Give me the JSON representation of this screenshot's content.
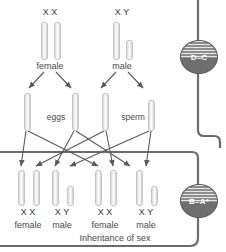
{
  "diagram": {
    "caption": "Inheritance of sex",
    "parents": [
      {
        "id": "mother",
        "alleles": "X X",
        "label": "female",
        "chromosomes": [
          "X",
          "X"
        ]
      },
      {
        "id": "father",
        "alleles": "X Y",
        "label": "male",
        "chromosomes": [
          "X",
          "Y"
        ]
      }
    ],
    "gametes": [
      {
        "id": "eggs",
        "label": "eggs",
        "chromosomes": [
          "X",
          "X"
        ]
      },
      {
        "id": "sperm",
        "label": "sperm",
        "chromosomes": [
          "X",
          "Y"
        ]
      }
    ],
    "offspring": [
      {
        "alleles": "X X",
        "label": "female",
        "chromosomes": [
          "X",
          "X"
        ]
      },
      {
        "alleles": "X Y",
        "label": "male",
        "chromosomes": [
          "X",
          "Y"
        ]
      },
      {
        "alleles": "X X",
        "label": "female",
        "chromosomes": [
          "X",
          "X"
        ]
      },
      {
        "alleles": "X Y",
        "label": "male",
        "chromosomes": [
          "X",
          "Y"
        ]
      }
    ]
  },
  "grade_badges": [
    {
      "id": "badge-d-c",
      "text": "D–C"
    },
    {
      "id": "badge-b-a-star",
      "text": "B–A*"
    }
  ],
  "colors": {
    "badge_fill": "#6f6f6f",
    "badge_text": "#ffffff",
    "frame_line": "#6b6b6b",
    "arrow": "#5a5a5a",
    "text": "#4a4a4a",
    "chromosome": "#e9e9e9"
  }
}
